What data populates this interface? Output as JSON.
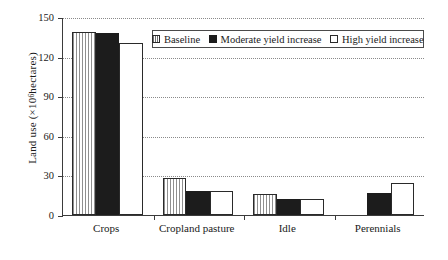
{
  "chart_data": {
    "type": "bar",
    "title": "",
    "subtitle": "",
    "xlabel": "",
    "ylabel": "Land use (×10⁶ hectares)",
    "ylabel_parts": {
      "prefix": "Land use (×10",
      "exponent": "6",
      "suffix": " hectares)"
    },
    "categories": [
      "Crops",
      "Cropland pasture",
      "Idle",
      "Perennials"
    ],
    "series": [
      {
        "name": "Baseline",
        "fill": "hatch",
        "values": [
          139,
          28,
          16,
          null
        ]
      },
      {
        "name": "Moderate yield increase",
        "fill": "solid",
        "values": [
          138,
          18,
          12,
          17
        ]
      },
      {
        "name": "High yield increase",
        "fill": "open",
        "values": [
          130,
          18,
          12,
          24
        ]
      }
    ],
    "ylim": [
      0,
      150
    ],
    "yticks": [
      0,
      30,
      60,
      90,
      120,
      150
    ],
    "ytick_labels": [
      "0",
      "30",
      "60",
      "90",
      "120",
      "150"
    ],
    "grid": true,
    "grid_axis": "y",
    "grid_style": "dotted",
    "legend_position": "top-right",
    "legend_entries": [
      "Baseline",
      "Moderate yield increase",
      "High yield increase"
    ],
    "colors": {
      "baseline_fill": "#ffffff",
      "baseline_hatch": "#8f8f8f",
      "moderate_fill": "#1c1c1c",
      "high_fill": "#ffffff",
      "axis": "#3b3b3b",
      "grid": "#8a8a8a",
      "text": "#1a1a1a",
      "background": "#ffffff"
    }
  }
}
